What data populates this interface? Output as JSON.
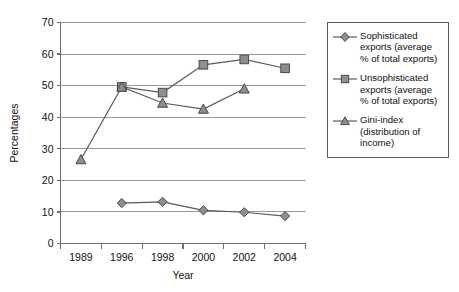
{
  "chart_data": {
    "type": "line",
    "title": "",
    "xlabel": "Year",
    "ylabel": "Percentages",
    "categories": [
      "1989",
      "1996",
      "1998",
      "2000",
      "2002",
      "2004"
    ],
    "x_tick_labels": [
      "1989",
      "1996",
      "1998",
      "2000",
      "2002",
      "2004"
    ],
    "y_tick_labels": [
      "0",
      "10",
      "20",
      "30",
      "40",
      "50",
      "60",
      "70"
    ],
    "y_ticks": [
      0,
      10,
      20,
      30,
      40,
      50,
      60,
      70
    ],
    "ylim": [
      0,
      70
    ],
    "grid": "horizontal",
    "legend_position": "right-outside",
    "series": [
      {
        "name": "Sophisticated exports (average % of total exports)",
        "marker": "diamond",
        "color": "#8e8e8e",
        "values": [
          null,
          12.8,
          13.2,
          10.5,
          9.9,
          8.7
        ]
      },
      {
        "name": "Unsophisticated exports (average % of total exports)",
        "marker": "square",
        "color": "#8e8e8e",
        "values": [
          null,
          49.6,
          47.8,
          56.6,
          58.3,
          55.5
        ]
      },
      {
        "name": "Gini-index (distribution of income)",
        "marker": "triangle",
        "color": "#8e8e8e",
        "values": [
          26.6,
          49.6,
          44.5,
          42.6,
          49.0,
          null
        ]
      }
    ]
  },
  "legend": {
    "items": [
      {
        "label": "Sophisticated\nexports (average\n% of total exports)",
        "marker": "diamond"
      },
      {
        "label": "Unsophisticated\nexports (average\n% of total exports)",
        "marker": "square"
      },
      {
        "label": "Gini-index\n(distribution of\nincome)",
        "marker": "triangle"
      }
    ]
  },
  "colors": {
    "marker_fill": "#8e8e8e",
    "marker_stroke": "#4a4a4a",
    "line": "#595959",
    "grid": "#9a9a9a",
    "axis": "#6f6f6f",
    "legend_border": "#5a5a5a",
    "background": "#ffffff"
  }
}
